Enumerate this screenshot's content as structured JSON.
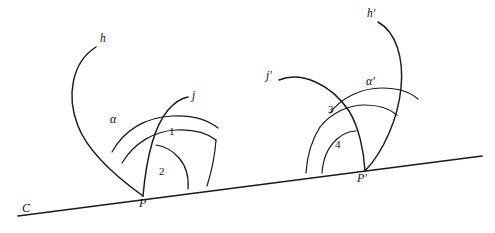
{
  "figure": {
    "type": "geometry-diagram",
    "background_color": "#ffffff",
    "stroke_color": "#1a1a1a"
  },
  "labels": {
    "line_c": "C",
    "vertex_p": "P",
    "vertex_p_prime": "P'",
    "ray_h": "h",
    "ray_j": "j",
    "ray_h_prime": "h'",
    "ray_j_prime": "j'",
    "angle_alpha": "α",
    "angle_alpha_prime": "α'",
    "angle_1": "1",
    "angle_2": "2",
    "angle_3": "3",
    "angle_4": "4"
  },
  "label_positions": {
    "line_c": {
      "x": 22,
      "y": 208
    },
    "vertex_p": {
      "x": 139,
      "y": 203
    },
    "vertex_p_prime": {
      "x": 357,
      "y": 176
    },
    "ray_h": {
      "x": 100,
      "y": 38
    },
    "ray_j": {
      "x": 192,
      "y": 94
    },
    "ray_h_prime": {
      "x": 367,
      "y": 12
    },
    "ray_j_prime": {
      "x": 268,
      "y": 74
    },
    "angle_alpha": {
      "x": 110,
      "y": 118
    },
    "angle_alpha_prime": {
      "x": 367,
      "y": 80
    },
    "angle_1": {
      "x": 168,
      "y": 131
    },
    "angle_2": {
      "x": 159,
      "y": 171
    },
    "angle_3": {
      "x": 327,
      "y": 109
    },
    "angle_4": {
      "x": 334,
      "y": 144
    }
  },
  "geometry": {
    "baseline": {
      "x1": 18,
      "y1": 216,
      "x2": 482,
      "y2": 156
    },
    "vertex_p": {
      "x": 143,
      "y": 196
    },
    "vertex_p_prime": {
      "x": 365,
      "y": 171
    },
    "curve_h": "M 96,47 C 72,62 66,96 78,126 C 88,152 118,178 143,196",
    "curve_j": "M 143,196 C 146,162 153,128 168,110 C 176,101 183,98 188,97",
    "curve_h_prime": "M 378,22 C 396,30 404,56 402,86 C 400,116 385,150 365,171",
    "curve_j_prime": "M 279,80 C 300,72 330,84 348,110 C 358,126 363,152 365,171",
    "arc_alpha": "M 116,146 C 128,128 148,118 172,117 C 190,117 205,122 214,129",
    "arc_mid_left": "M 125,156 C 138,139 156,131 176,131 C 192,131 205,135 213,141",
    "arc_outer_left_foot": "M 188,189 C 194,170 200,154 207,142",
    "arc_2": "M 158,194 C 160,180 167,168 178,161 C 184,157 190,156 194,156",
    "arc_alpha_prime": "M 332,110 C 344,96 362,88 381,88 C 396,88 407,92 414,98",
    "arc_mid_right": "M 322,124 C 333,112 348,105 364,105 C 377,105 387,108 393,113",
    "arc_3_foot": "M 308,172 C 308,155 312,138 320,125",
    "arc_4": "M 322,172 C 322,158 327,146 336,138 C 342,133 348,131 353,131",
    "arc_4_inner_foot": "M 336,172 C 336,162 340,152 347,145",
    "ray_pp_j": "M 365,171 L 399,137",
    "ray_pp_h_left": "M 365,171 L 308,172"
  }
}
